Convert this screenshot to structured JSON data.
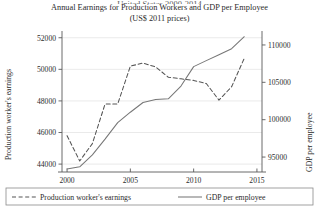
{
  "figure": {
    "clipped_top_line": "United States 2000-2014",
    "title_lines": [
      "Annual Earnings for Production Workers and GDP per Employee",
      "(US$ 2011 prices)"
    ]
  },
  "axes": {
    "left_title": "Production worker's earnings",
    "right_title": "GDP per employee",
    "x_ticks": [
      "2000",
      "2005",
      "2010",
      "2015"
    ],
    "left_ticks": [
      "44000",
      "46000",
      "48000",
      "50000",
      "52000"
    ],
    "right_ticks": [
      "95000",
      "100000",
      "105000",
      "110000"
    ]
  },
  "legend": {
    "items": [
      {
        "label": "Production worker's earnings",
        "style": "dashed",
        "color": "#555555"
      },
      {
        "label": "GDP per employee",
        "style": "solid",
        "color": "#777777"
      }
    ]
  },
  "chart_data": {
    "type": "line",
    "title": "Annual Earnings for Production Workers and GDP per Employee (US$ 2011 prices)",
    "subtitle": "(US$ 2011 prices)",
    "xlabel": "",
    "ylabel": "Production worker's earnings",
    "ylabel_right": "GDP per employee",
    "grid": true,
    "legend_position": "below-axes",
    "x": [
      2000,
      2001,
      2002,
      2003,
      2004,
      2005,
      2006,
      2007,
      2008,
      2009,
      2010,
      2011,
      2012,
      2013,
      2014
    ],
    "xlim": [
      1999.6,
      2015.4
    ],
    "ylim_left": [
      43500,
      52300
    ],
    "ylim_right": [
      93000,
      111600
    ],
    "series": [
      {
        "name": "Production worker's earnings",
        "axis": "left",
        "style": "dashed",
        "color": "#555555",
        "values": [
          45800,
          44200,
          45300,
          47800,
          47800,
          50200,
          50400,
          50150,
          49500,
          49400,
          49300,
          49100,
          48050,
          48900,
          50700
        ]
      },
      {
        "name": "GDP per employee",
        "axis": "right",
        "style": "solid",
        "color": "#777777",
        "values": [
          93400,
          93700,
          95300,
          97400,
          99600,
          101000,
          102300,
          102700,
          102800,
          104500,
          107100,
          107900,
          108700,
          109500,
          111100
        ]
      }
    ]
  }
}
